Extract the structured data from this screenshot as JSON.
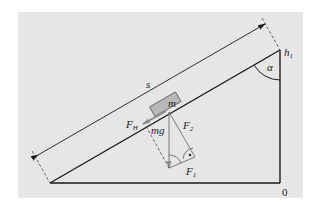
{
  "diagram": {
    "colors": {
      "background": "#e6e6e6",
      "line": "#1a1a1a",
      "vector": "#7a7a7a",
      "block_fill": "#b8b8b8",
      "dashed": "#444444"
    },
    "labels": {
      "distance": "s",
      "mass": "m",
      "weight": "mg",
      "force_parallel_arrow": "F",
      "force_parallel_arrow_sub": "H",
      "force_perpendicular": "F",
      "force_perpendicular_sub": "2",
      "force_component": "F",
      "force_component_sub": "1",
      "height": "h",
      "height_sub": "1",
      "angle": "α",
      "zero": "0"
    }
  }
}
